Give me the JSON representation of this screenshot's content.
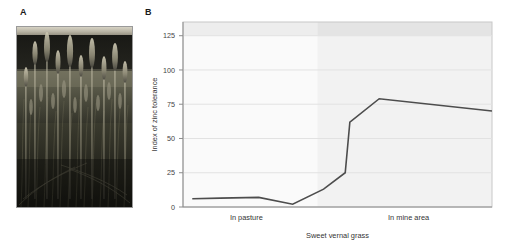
{
  "figure": {
    "panel_a": {
      "label": "A",
      "image_alt": "sweet vernal grass",
      "photo_name": "grass-photograph"
    },
    "panel_b": {
      "label": "B"
    }
  },
  "chart_data": {
    "type": "line",
    "title": "",
    "xlabel": "Sweet vernal grass",
    "ylabel": "Index of zinc tolerance",
    "ylim": [
      0,
      135
    ],
    "yticks": [
      0,
      25,
      50,
      75,
      100,
      125
    ],
    "ytick_labels": [
      "0",
      "25",
      "50",
      "75",
      "100",
      "125"
    ],
    "xlim": [
      0,
      10
    ],
    "categories": [
      "In pasture",
      "In mine area"
    ],
    "category_positions": [
      2.05,
      7.3
    ],
    "grid": "horizontal",
    "legend": "none",
    "regions": [
      {
        "name": "pasture-region",
        "x_start": 0,
        "x_end": 4.35,
        "color": "#fafafa"
      },
      {
        "name": "mine-region",
        "x_start": 4.35,
        "x_end": 10,
        "color": "#f2f2f2"
      }
    ],
    "top_band": {
      "name": "upper-shaded-band",
      "y_start": 125,
      "y_end": 135,
      "color": "#eaeaea"
    },
    "series": [
      {
        "name": "Index of zinc tolerance",
        "color": "#4d4d4d",
        "x": [
          0.3,
          1.2,
          2.45,
          3.55,
          4.55,
          5.25,
          5.4,
          6.35,
          10.0
        ],
        "y": [
          6,
          6.5,
          7,
          2,
          13,
          25,
          62,
          79,
          70
        ]
      }
    ]
  }
}
